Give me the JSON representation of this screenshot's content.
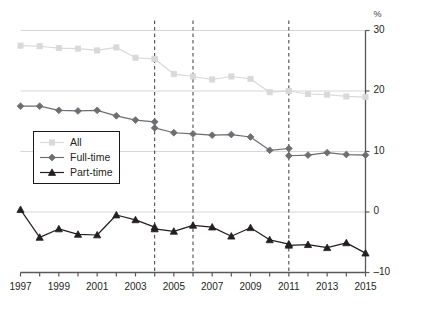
{
  "chart_data": {
    "type": "line",
    "title": "",
    "subtitle": "",
    "xlabel": "",
    "ylabel": "",
    "unit_label": "%",
    "xlim": [
      1997,
      2015
    ],
    "ylim": [
      -10,
      30
    ],
    "yticks": [
      -10,
      0,
      10,
      20,
      30
    ],
    "ytick_labels": [
      "–10",
      "0",
      "10",
      "20",
      "30"
    ],
    "xticks": [
      1997,
      1998,
      1999,
      2000,
      2001,
      2002,
      2003,
      2004,
      2005,
      2006,
      2007,
      2008,
      2009,
      2010,
      2011,
      2012,
      2013,
      2014,
      2015
    ],
    "xtick_labels": [
      "1997",
      "",
      "1999",
      "",
      "2001",
      "",
      "2003",
      "",
      "2005",
      "",
      "2007",
      "",
      "2009",
      "",
      "2011",
      "",
      "2013",
      "",
      "2015"
    ],
    "grid": true,
    "gridlines_y": [
      0,
      10,
      20,
      30
    ],
    "legend_position": "center-left",
    "break_lines_x": [
      2004,
      2006,
      2011
    ],
    "x": [
      1997,
      1998,
      1999,
      2000,
      2001,
      2002,
      2003,
      2004,
      2005,
      2006,
      2007,
      2008,
      2009,
      2010,
      2011,
      2012,
      2013,
      2014,
      2015
    ],
    "series": [
      {
        "name": "All",
        "color": "#d9d9d9",
        "marker": "square",
        "values": [
          27.5,
          27.4,
          27.1,
          27.0,
          26.7,
          27.2,
          25.5,
          25.3,
          22.8,
          22.4,
          21.9,
          22.4,
          22.0,
          19.8,
          20.0,
          19.5,
          19.4,
          19.1,
          19.0
        ],
        "break_values": {
          "2004": [
            25.3,
            25.3
          ],
          "2011": [
            20.0,
            20.0
          ]
        }
      },
      {
        "name": "Full-time",
        "color": "#6d6e71",
        "marker": "diamond",
        "values": [
          17.5,
          17.5,
          16.8,
          16.7,
          16.8,
          15.9,
          15.2,
          14.9,
          13.1,
          12.9,
          12.7,
          12.8,
          12.4,
          10.2,
          10.5,
          9.4,
          9.8,
          9.5,
          9.4
        ],
        "break_values": {
          "2004": [
            14.9,
            13.9
          ],
          "2011": [
            10.5,
            9.3
          ]
        }
      },
      {
        "name": "Part-time",
        "color": "#231f20",
        "marker": "triangle",
        "values": [
          0.4,
          -4.2,
          -2.8,
          -3.7,
          -3.8,
          -0.5,
          -1.3,
          -2.5,
          -3.2,
          -2.2,
          -2.5,
          -4.0,
          -2.6,
          -4.6,
          -5.4,
          -5.4,
          -5.9,
          -5.1,
          -6.8
        ],
        "break_values": {
          "2004": [
            -2.5,
            -2.8
          ],
          "2011": [
            -5.3,
            -5.5
          ]
        }
      }
    ]
  },
  "legend": {
    "items": [
      {
        "label": "All"
      },
      {
        "label": "Full-time"
      },
      {
        "label": "Part-time"
      }
    ]
  }
}
